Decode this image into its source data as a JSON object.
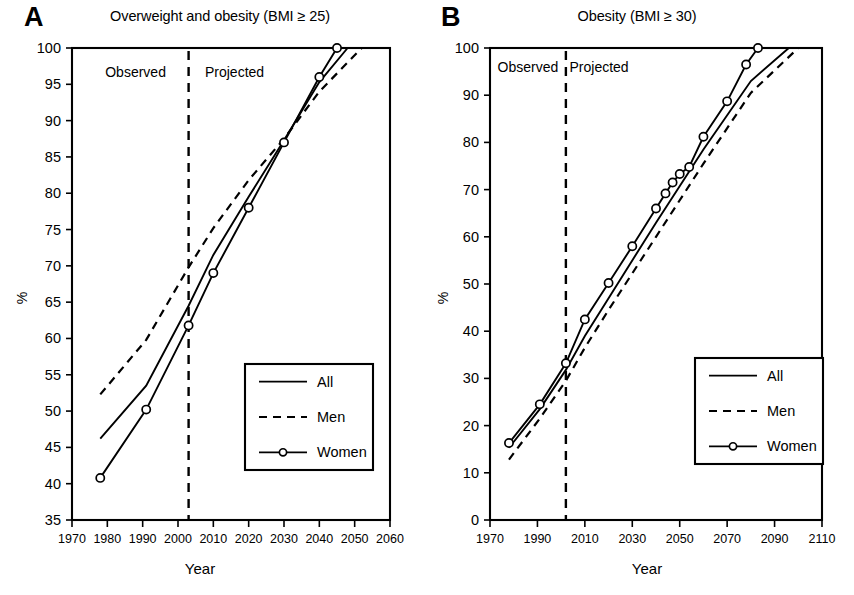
{
  "figure": {
    "panels": [
      {
        "letter": "A",
        "title": "Overweight and obesity (BMI ≥ 25)",
        "xlabel": "Year",
        "ylabel": "%",
        "observed_label": "Observed",
        "projected_label": "Projected",
        "legend": [
          "All",
          "Men",
          "Women"
        ]
      },
      {
        "letter": "B",
        "title": "Obesity (BMI ≥ 30)",
        "xlabel": "Year",
        "ylabel": "%",
        "observed_label": "Observed",
        "projected_label": "Projected",
        "legend": [
          "All",
          "Men",
          "Women"
        ]
      }
    ]
  },
  "chart_data": [
    {
      "type": "line",
      "panel": "A",
      "title": "Overweight and obesity (BMI ≥ 25)",
      "xlabel": "Year",
      "ylabel": "%",
      "xlim": [
        1970,
        2060
      ],
      "ylim": [
        35,
        100
      ],
      "xticks": [
        1970,
        1980,
        1990,
        2000,
        2010,
        2020,
        2030,
        2040,
        2050,
        2060
      ],
      "yticks": [
        35,
        40,
        45,
        50,
        55,
        60,
        65,
        70,
        75,
        80,
        85,
        90,
        95,
        100
      ],
      "grid": false,
      "legend_position": "lower right",
      "annotations": [
        {
          "text": "Observed",
          "x": 1988,
          "y": 96
        },
        {
          "text": "Projected",
          "x": 2016,
          "y": 96
        }
      ],
      "divider_year": 2003,
      "series": [
        {
          "name": "All",
          "style": "solid",
          "marker": "none",
          "x": [
            1978,
            1991,
            2003,
            2010,
            2020,
            2030,
            2040,
            2048
          ],
          "y": [
            46.2,
            53.5,
            64.5,
            71.5,
            79.5,
            87.3,
            95.3,
            100.0
          ]
        },
        {
          "name": "Men",
          "style": "dashed",
          "marker": "none",
          "x": [
            1978,
            1991,
            2003,
            2010,
            2020,
            2030,
            2040,
            2052
          ],
          "y": [
            52.3,
            59.8,
            69.8,
            75.2,
            81.8,
            87.5,
            94.0,
            100.0
          ]
        },
        {
          "name": "Women",
          "style": "solid",
          "marker": "circle",
          "x": [
            1978,
            1991,
            2003,
            2010,
            2020,
            2030,
            2040,
            2045
          ],
          "y": [
            40.8,
            50.2,
            61.8,
            69.0,
            78.0,
            87.0,
            96.0,
            100.0
          ]
        }
      ]
    },
    {
      "type": "line",
      "panel": "B",
      "title": "Obesity (BMI ≥ 30)",
      "xlabel": "Year",
      "ylabel": "%",
      "xlim": [
        1970,
        2110
      ],
      "ylim": [
        0,
        100
      ],
      "xticks": [
        1970,
        1990,
        2010,
        2030,
        2050,
        2070,
        2090,
        2110
      ],
      "yticks": [
        0,
        10,
        20,
        30,
        40,
        50,
        60,
        70,
        80,
        90,
        100
      ],
      "grid": false,
      "legend_position": "lower right",
      "annotations": [
        {
          "text": "Observed",
          "x": 1986,
          "y": 95
        },
        {
          "text": "Projected",
          "x": 2016,
          "y": 95
        }
      ],
      "divider_year": 2002,
      "series": [
        {
          "name": "All",
          "style": "solid",
          "marker": "none",
          "x": [
            1978,
            1991,
            2002,
            2010,
            2020,
            2040,
            2060,
            2080,
            2096
          ],
          "y": [
            15.3,
            23.5,
            31.8,
            39.0,
            47.0,
            63.0,
            78.5,
            93.0,
            100.0
          ]
        },
        {
          "name": "Men",
          "style": "dashed",
          "marker": "none",
          "x": [
            1978,
            1991,
            2002,
            2010,
            2020,
            2040,
            2060,
            2080,
            2100
          ],
          "y": [
            12.8,
            21.5,
            29.5,
            36.5,
            44.5,
            60.0,
            75.5,
            90.5,
            100.0
          ]
        },
        {
          "name": "Women",
          "style": "solid",
          "marker": "circle",
          "x": [
            1978,
            1991,
            2002,
            2010,
            2020,
            2030,
            2040,
            2044,
            2047,
            2050,
            2054,
            2060,
            2070,
            2078,
            2083
          ],
          "y": [
            16.3,
            24.5,
            33.2,
            42.5,
            50.2,
            58.0,
            66.0,
            69.2,
            71.5,
            73.3,
            74.8,
            81.2,
            88.7,
            96.5,
            100.0
          ]
        }
      ]
    }
  ]
}
